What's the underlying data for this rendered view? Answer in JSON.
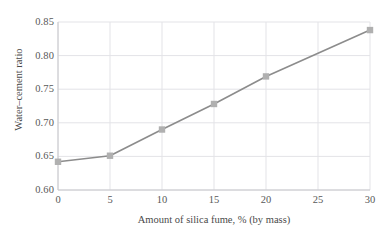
{
  "chart_data": {
    "type": "line",
    "title": "",
    "xlabel": "Amount of silica fume, % (by mass)",
    "ylabel": "Water–cement ratio",
    "x": [
      0,
      5,
      10,
      15,
      20,
      30
    ],
    "values": [
      0.642,
      0.651,
      0.69,
      0.728,
      0.769,
      0.838
    ],
    "series": [
      {
        "name": "Water-cement ratio",
        "x": [
          0,
          5,
          10,
          15,
          20,
          30
        ],
        "values": [
          0.642,
          0.651,
          0.69,
          0.728,
          0.769,
          0.838
        ]
      }
    ],
    "xlim": [
      0,
      30
    ],
    "ylim": [
      0.6,
      0.85
    ],
    "xticks": [
      0,
      5,
      10,
      15,
      20,
      25,
      30
    ],
    "xtick_labels": [
      "0",
      "5",
      "10",
      "15",
      "20",
      "25",
      "30"
    ],
    "yticks": [
      0.6,
      0.65,
      0.7,
      0.75,
      0.8,
      0.85
    ],
    "ytick_labels": [
      "0.60",
      "0.65",
      "0.70",
      "0.75",
      "0.80",
      "0.85"
    ],
    "grid": true,
    "legend": "none",
    "marker": "square",
    "line_color": "#8c8c8c",
    "marker_color": "#b0b0b0",
    "grid_color": "#e3e3e7",
    "axis_color": "#c8c8cc",
    "background": "#ffffff"
  }
}
